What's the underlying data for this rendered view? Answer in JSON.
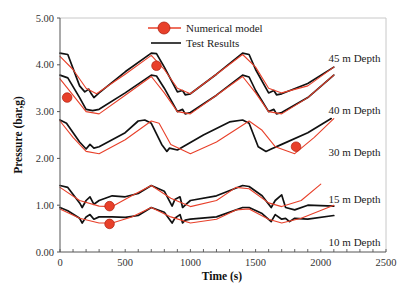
{
  "chart_data": {
    "type": "line",
    "title": "",
    "xlabel": "Time (s)",
    "ylabel": "Pressure (bar,g)",
    "xlim": [
      0,
      2500
    ],
    "ylim": [
      0,
      5
    ],
    "x_ticks": [
      0,
      500,
      1000,
      1500,
      2000,
      2500
    ],
    "x_tick_labels": [
      "0",
      "500",
      "1000",
      "1500",
      "2000",
      "2500"
    ],
    "x_minor_tick_step": 100,
    "y_ticks": [
      0,
      1,
      2,
      3,
      4,
      5
    ],
    "y_tick_labels": [
      "0.00",
      "1.00",
      "2.00",
      "3.00",
      "4.00",
      "5.00"
    ],
    "grid": false,
    "legend": {
      "position": "top-center",
      "entries": [
        {
          "label": "Numerical model",
          "color": "#e8402a",
          "marker": "circle"
        },
        {
          "label": "Test Results",
          "color": "#111111",
          "marker": "none"
        }
      ]
    },
    "annotations": [
      {
        "text": "45 m Depth",
        "x": 2060,
        "y": 4.05
      },
      {
        "text": "40 m Depth",
        "x": 2060,
        "y": 2.95
      },
      {
        "text": "30 m Depth",
        "x": 2060,
        "y": 2.05
      },
      {
        "text": "15 m  Depth",
        "x": 2060,
        "y": 1.05
      },
      {
        "text": "10 m Depth",
        "x": 2060,
        "y": 0.12
      }
    ],
    "groups": [
      {
        "depth": "45 m Depth",
        "marker": {
          "x": 740,
          "y": 3.98
        },
        "series": [
          {
            "name": "Test Results",
            "color": "#111111",
            "x": [
              0,
              60,
              150,
              190,
              220,
              240,
              260,
              300,
              500,
              700,
              740,
              800,
              900,
              940,
              960,
              1000,
              1200,
              1400,
              1450,
              1500,
              1600,
              1640,
              1660,
              1700,
              1900,
              2100
            ],
            "y": [
              4.25,
              4.22,
              3.55,
              3.42,
              3.48,
              3.38,
              3.3,
              3.4,
              3.85,
              4.25,
              4.24,
              3.95,
              3.42,
              3.45,
              3.36,
              3.38,
              3.8,
              4.25,
              4.22,
              3.9,
              3.4,
              3.45,
              3.36,
              3.38,
              3.6,
              3.95
            ]
          },
          {
            "name": "Numerical model",
            "color": "#e8402a",
            "x": [
              0,
              100,
              200,
              280,
              500,
              700,
              800,
              900,
              1000,
              1200,
              1400,
              1500,
              1600,
              1700,
              1900,
              2100
            ],
            "y": [
              4.18,
              3.9,
              3.5,
              3.38,
              3.8,
              4.2,
              3.9,
              3.5,
              3.38,
              3.8,
              4.22,
              3.95,
              3.5,
              3.4,
              3.55,
              3.95
            ]
          }
        ]
      },
      {
        "depth": "40 m Depth",
        "marker": {
          "x": 55,
          "y": 3.3
        },
        "series": [
          {
            "name": "Test Results",
            "color": "#111111",
            "x": [
              0,
              60,
              150,
              200,
              250,
              300,
              500,
              700,
              740,
              800,
              900,
              940,
              960,
              1000,
              1200,
              1400,
              1450,
              1500,
              1600,
              1640,
              1660,
              1700,
              1900,
              2100
            ],
            "y": [
              3.78,
              3.72,
              3.3,
              3.05,
              3.02,
              3.05,
              3.4,
              3.78,
              3.76,
              3.5,
              3.0,
              3.05,
              2.95,
              2.98,
              3.35,
              3.78,
              3.74,
              3.45,
              3.0,
              3.05,
              2.95,
              2.98,
              3.3,
              3.78
            ]
          },
          {
            "name": "Numerical model",
            "color": "#e8402a",
            "x": [
              0,
              100,
              200,
              300,
              500,
              700,
              800,
              900,
              1000,
              1200,
              1400,
              1500,
              1600,
              1700,
              1900,
              2100
            ],
            "y": [
              3.7,
              3.35,
              3.0,
              2.95,
              3.35,
              3.75,
              3.4,
              3.0,
              2.95,
              3.35,
              3.75,
              3.4,
              3.0,
              2.95,
              3.3,
              3.78
            ]
          }
        ]
      },
      {
        "depth": "30 m Depth",
        "marker": {
          "x": 1810,
          "y": 2.25
        },
        "series": [
          {
            "name": "Test Results",
            "color": "#111111",
            "x": [
              0,
              50,
              150,
              200,
              230,
              260,
              300,
              500,
              600,
              650,
              700,
              780,
              820,
              840,
              900,
              1100,
              1300,
              1400,
              1450,
              1520,
              1580,
              1620,
              1700,
              1900,
              2080
            ],
            "y": [
              2.82,
              2.75,
              2.35,
              2.2,
              2.3,
              2.22,
              2.25,
              2.55,
              2.8,
              2.82,
              2.75,
              2.3,
              2.15,
              2.22,
              2.18,
              2.5,
              2.78,
              2.82,
              2.75,
              2.25,
              2.15,
              2.2,
              2.3,
              2.55,
              2.85
            ]
          },
          {
            "name": "Numerical model",
            "color": "#e8402a",
            "x": [
              0,
              100,
              200,
              300,
              500,
              700,
              760,
              850,
              1000,
              1200,
              1450,
              1550,
              1650,
              1800,
              1950,
              2100
            ],
            "y": [
              2.8,
              2.45,
              2.15,
              2.1,
              2.4,
              2.8,
              2.75,
              2.3,
              2.1,
              2.35,
              2.8,
              2.6,
              2.25,
              2.1,
              2.45,
              2.85
            ]
          }
        ]
      },
      {
        "depth": "15 m  Depth",
        "marker": {
          "x": 380,
          "y": 0.98
        },
        "series": [
          {
            "name": "Test Results",
            "color": "#111111",
            "x": [
              0,
              60,
              150,
              170,
              200,
              230,
              260,
              300,
              400,
              500,
              600,
              700,
              800,
              860,
              880,
              920,
              940,
              960,
              1000,
              1200,
              1400,
              1450,
              1550,
              1620,
              1650,
              1700,
              1730,
              1800,
              1900,
              2100
            ],
            "y": [
              1.42,
              1.38,
              1.05,
              0.95,
              1.1,
              1.18,
              1.02,
              1.1,
              1.2,
              1.18,
              1.25,
              1.42,
              1.3,
              0.98,
              1.12,
              1.18,
              0.95,
              1.0,
              1.1,
              1.2,
              1.42,
              1.4,
              1.2,
              0.95,
              1.1,
              1.22,
              0.95,
              0.9,
              1.0,
              0.98
            ]
          },
          {
            "name": "Numerical model",
            "color": "#e8402a",
            "x": [
              0,
              150,
              300,
              400,
              550,
              700,
              850,
              1000,
              1200,
              1350,
              1450,
              1600,
              1700,
              1850,
              2000
            ],
            "y": [
              1.38,
              1.1,
              0.98,
              0.97,
              1.2,
              1.42,
              1.15,
              0.97,
              1.1,
              1.38,
              1.35,
              1.05,
              0.97,
              1.1,
              1.45
            ]
          }
        ]
      },
      {
        "depth": "10 m Depth",
        "marker": {
          "x": 380,
          "y": 0.6
        },
        "series": [
          {
            "name": "Test Results",
            "color": "#111111",
            "x": [
              0,
              60,
              150,
              170,
              200,
              230,
              260,
              300,
              400,
              500,
              600,
              700,
              800,
              860,
              880,
              920,
              940,
              960,
              1000,
              1200,
              1400,
              1450,
              1550,
              1620,
              1650,
              1700,
              1730,
              1760,
              1800,
              1900,
              2100
            ],
            "y": [
              0.95,
              0.88,
              0.72,
              0.62,
              0.75,
              0.8,
              0.7,
              0.75,
              0.75,
              0.74,
              0.78,
              0.95,
              0.85,
              0.62,
              0.72,
              0.8,
              0.62,
              0.68,
              0.7,
              0.75,
              0.95,
              0.95,
              0.82,
              0.65,
              0.8,
              0.7,
              0.72,
              0.65,
              0.72,
              0.7,
              0.78
            ]
          },
          {
            "name": "Numerical model",
            "color": "#e8402a",
            "x": [
              0,
              150,
              300,
              400,
              550,
              700,
              850,
              1000,
              1200,
              1350,
              1450,
              1600,
              1700,
              1850,
              2100
            ],
            "y": [
              0.92,
              0.72,
              0.62,
              0.62,
              0.75,
              0.95,
              0.75,
              0.62,
              0.7,
              0.9,
              0.92,
              0.7,
              0.62,
              0.72,
              1.0
            ]
          }
        ]
      }
    ]
  },
  "layout": {
    "plot": {
      "left": 60,
      "top": 18,
      "right": 386,
      "bottom": 252
    },
    "colors": {
      "model": "#e8402a",
      "test": "#111111",
      "axis": "#555555",
      "frame": "#c8c8c8"
    }
  }
}
